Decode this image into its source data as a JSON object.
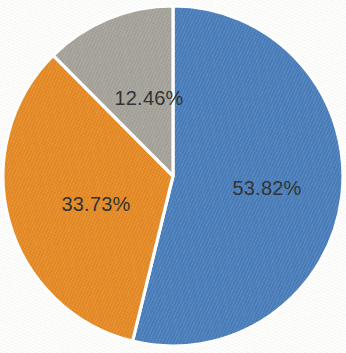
{
  "chart_data": {
    "type": "pie",
    "title": "",
    "subtitle": "",
    "xlabel": "",
    "ylabel": "",
    "legend": "none",
    "grid": false,
    "labels_shown": "percentage",
    "start_angle_deg": 0,
    "direction": "clockwise",
    "categories": [
      "Series 1",
      "Series 2",
      "Series 3"
    ],
    "values": [
      53.82,
      33.73,
      12.46
    ],
    "slices": [
      {
        "label": "53.82%",
        "value": 53.82,
        "color": "#4a7ebb",
        "start_angle_deg": 0,
        "sweep_angle_deg": 193.75,
        "label_x": 267,
        "label_y": 188
      },
      {
        "label": "33.73%",
        "value": 33.73,
        "color": "#e58a25",
        "start_angle_deg": 193.75,
        "sweep_angle_deg": 121.43,
        "label_x": 96,
        "label_y": 204
      },
      {
        "label": "12.46%",
        "value": 12.46,
        "color": "#a5a29a",
        "start_angle_deg": 315.18,
        "sweep_angle_deg": 44.82,
        "label_x": 149,
        "label_y": 98
      }
    ],
    "geometry": {
      "center_x": 173,
      "center_y": 176,
      "radius": 170,
      "separator_color": "#ffffff",
      "separator_width": 3.2
    },
    "background_color": "#fdfdfc",
    "label_text_color": "#2e2e2e"
  }
}
